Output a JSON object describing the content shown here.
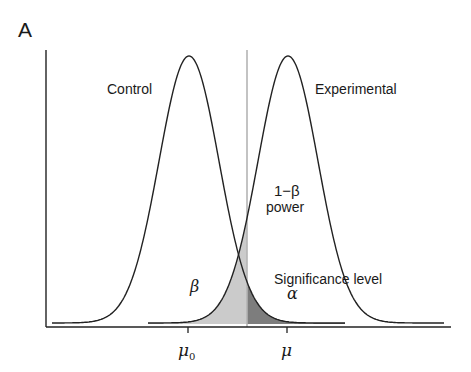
{
  "panel_label": "A",
  "curves": {
    "control": {
      "label": "Control",
      "mean_label": "μ",
      "mean_subscript": "0"
    },
    "experimental": {
      "label": "Experimental",
      "mean_label": "μ"
    }
  },
  "annotations": {
    "power_line1": "1−β",
    "power_line2": "power",
    "beta": "β",
    "alpha": "α",
    "significance": "Significance level"
  },
  "colors": {
    "curve": "#222222",
    "beta_region": "#c8c8c8",
    "alpha_region": "#7a7a7a",
    "threshold_line": "#b0b0b0"
  },
  "chart_data": {
    "type": "area",
    "title": "",
    "xlabel": "",
    "ylabel": "",
    "series": [
      {
        "name": "Control",
        "distribution": "normal",
        "mean": "μ0"
      },
      {
        "name": "Experimental",
        "distribution": "normal",
        "mean": "μ"
      }
    ],
    "x_ticks": [
      "μ0",
      "μ"
    ],
    "regions": [
      {
        "name": "β",
        "description": "Experimental area left of threshold"
      },
      {
        "name": "α",
        "description": "Significance level: Control area right of threshold"
      },
      {
        "name": "1−β power",
        "description": "Experimental area right of threshold"
      }
    ]
  }
}
